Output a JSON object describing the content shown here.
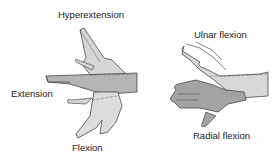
{
  "diagram": {
    "left_panel": {
      "labels": {
        "top": "Hyperextension",
        "left": "Extension",
        "bottom": "Flexion"
      }
    },
    "right_panel": {
      "labels": {
        "top": "Ulnar flexion",
        "bottom": "Radial flexion"
      }
    },
    "colors": {
      "hand_light": "#d9d9d9",
      "hand_mid": "#b8b8b8",
      "hand_dark": "#9a9a9a",
      "outline": "#333333"
    }
  }
}
